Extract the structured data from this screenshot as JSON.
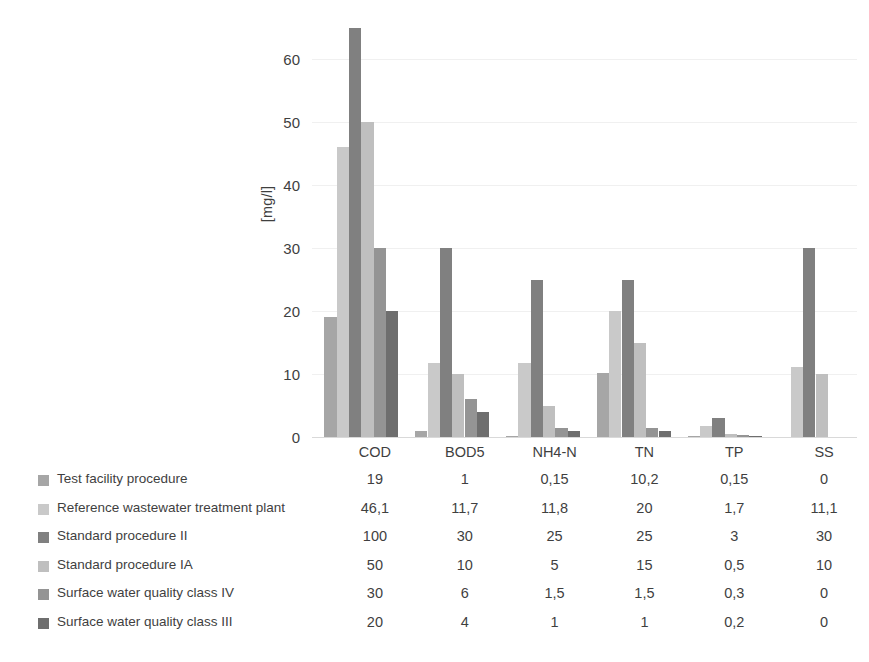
{
  "chart_data": {
    "type": "bar",
    "title": "",
    "xlabel": "",
    "ylabel": "[mg/l]",
    "categories": [
      "COD",
      "BOD5",
      "NH4-N",
      "TN",
      "TP",
      "SS"
    ],
    "ylim": [
      0,
      65
    ],
    "yticks": [
      0,
      10,
      20,
      30,
      40,
      50,
      60
    ],
    "grid": true,
    "legend_position": "bottom-left-table",
    "note_clipped": "Values above the plotted axis maximum are clipped (e.g. COD Standard procedure II = 100)",
    "series": [
      {
        "name": "Test facility procedure",
        "color": "#a6a6a6",
        "values": [
          19,
          1,
          0.15,
          10.2,
          0.15,
          0
        ],
        "labels": [
          "19",
          "1",
          "0,15",
          "10,2",
          "0,15",
          "0"
        ]
      },
      {
        "name": "Reference wastewater treatment plant",
        "color": "#c9c9c9",
        "values": [
          46.1,
          11.7,
          11.8,
          20,
          1.7,
          11.1
        ],
        "labels": [
          "46,1",
          "11,7",
          "11,8",
          "20",
          "1,7",
          "11,1"
        ]
      },
      {
        "name": "Standard procedure II",
        "color": "#808080",
        "values": [
          100,
          30,
          25,
          25,
          3,
          30
        ],
        "labels": [
          "100",
          "30",
          "25",
          "25",
          "3",
          "30"
        ]
      },
      {
        "name": "Standard procedure IA",
        "color": "#bfbfbf",
        "values": [
          50,
          10,
          5,
          15,
          0.5,
          10
        ],
        "labels": [
          "50",
          "10",
          "5",
          "15",
          "0,5",
          "10"
        ]
      },
      {
        "name": "Surface water quality class IV",
        "color": "#949494",
        "values": [
          30,
          6,
          1.5,
          1.5,
          0.3,
          0
        ],
        "labels": [
          "30",
          "6",
          "1,5",
          "1,5",
          "0,3",
          "0"
        ]
      },
      {
        "name": "Surface water quality class III",
        "color": "#6e6e6e",
        "values": [
          20,
          4,
          1,
          1,
          0.2,
          0
        ],
        "labels": [
          "20",
          "4",
          "1",
          "1",
          "0,2",
          "0"
        ]
      }
    ]
  }
}
